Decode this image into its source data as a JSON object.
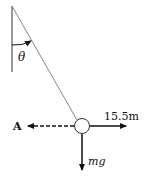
{
  "diagram": {
    "type": "free-body-diagram",
    "angle_label": "θ",
    "forces": [
      {
        "label": "15.5m",
        "direction": "right",
        "style": "solid"
      },
      {
        "label": "mg",
        "direction": "down",
        "style": "solid"
      },
      {
        "label": "A",
        "direction": "left",
        "style": "dashed"
      }
    ],
    "colors": {
      "ink": "#111111",
      "string": "#888888"
    }
  }
}
